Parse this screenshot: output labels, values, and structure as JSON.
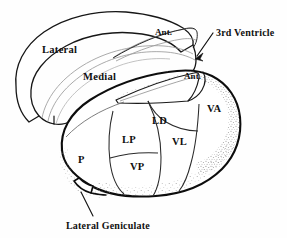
{
  "figure": {
    "background_color": "#fefefe",
    "ink_color": "#101010",
    "thin_line_color": "#8e8e8e",
    "stipple_color": "#9a9a9a"
  },
  "labels": {
    "lateral": "Lateral",
    "medial": "Medial",
    "ant_upper": "Ant.",
    "ant_lower": "Ant.",
    "third_ventricle": "3rd Ventricle",
    "lateral_geniculate": "Lateral Geniculate"
  },
  "nuclei": [
    {
      "abbr": "P",
      "name": "pulvinar",
      "x": 84,
      "y": 159
    },
    {
      "abbr": "LP",
      "name": "lateral-posterior",
      "x": 131,
      "y": 139
    },
    {
      "abbr": "VP",
      "name": "ventral-posterior",
      "x": 139,
      "y": 166
    },
    {
      "abbr": "LD",
      "name": "lateral-dorsal",
      "x": 160,
      "y": 120
    },
    {
      "abbr": "VL",
      "name": "ventral-lateral",
      "x": 180,
      "y": 141
    },
    {
      "abbr": "VA",
      "name": "ventral-anterior",
      "x": 215,
      "y": 108
    }
  ],
  "callouts": [
    {
      "key": "third_ventricle",
      "text": "3rd Ventricle",
      "text_x": 216,
      "text_y": 36,
      "line": [
        [
          213,
          33
        ],
        [
          196,
          57
        ]
      ]
    },
    {
      "key": "lateral_geniculate",
      "text": "Lateral Geniculate",
      "text_x": 66,
      "text_y": 228,
      "line": [
        [
          93,
          215
        ],
        [
          80,
          193
        ]
      ]
    }
  ],
  "region_labels": [
    {
      "key": "lateral",
      "text": "Lateral",
      "x": 42,
      "y": 53
    },
    {
      "key": "medial",
      "text": "Medial",
      "x": 83,
      "y": 80
    },
    {
      "key": "ant_upper",
      "text": "Ant.",
      "x": 155,
      "y": 35
    },
    {
      "key": "ant_lower",
      "text": "Ant.",
      "x": 184,
      "y": 79
    }
  ]
}
